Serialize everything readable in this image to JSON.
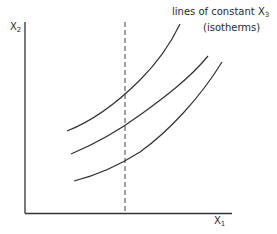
{
  "diagram": {
    "y_axis_label": {
      "base": "X",
      "sub": "2"
    },
    "x_axis_label": {
      "base": "X",
      "sub": "1"
    },
    "annotation": {
      "line1_text": "lines of constant X",
      "line1_sub": "3",
      "line2_text": "(isotherms)"
    },
    "curves": [
      {
        "name": "isotherm-1",
        "path": "M67,131 C95,120 120,100 140,80 C158,62 170,45 180,24"
      },
      {
        "name": "isotherm-2",
        "path": "M71,154 C95,144 118,131 140,115 C165,97 190,78 208,56"
      },
      {
        "name": "isotherm-3",
        "path": "M74,181 C98,175 118,166 140,152 C168,132 200,98 222,62"
      }
    ],
    "dashed_line": {
      "x": 125,
      "y1": 22,
      "y2": 213
    },
    "colors": {
      "line": "#333333",
      "text": "#2a2a2a"
    }
  }
}
